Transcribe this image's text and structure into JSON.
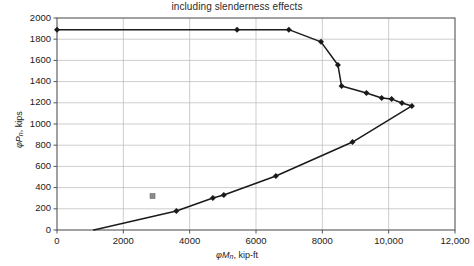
{
  "chart_data": {
    "type": "line",
    "title": "including slenderness effects",
    "xlabel": "φMn, kip-ft",
    "ylabel": "φPn, kips",
    "xlabel_parts": {
      "phi": "φ",
      "sym": "M",
      "sub": "n",
      "rest": ", kip-ft"
    },
    "ylabel_parts": {
      "phi": "φ",
      "sym": "P",
      "sub": "n",
      "rest": ", kips"
    },
    "xlim": [
      0,
      12000
    ],
    "ylim": [
      0,
      2000
    ],
    "xticks": [
      0,
      2000,
      4000,
      6000,
      8000,
      10000,
      12000
    ],
    "xtick_labels": [
      "0",
      "2000",
      "4000",
      "6000",
      "8000",
      "10,000",
      "12,000"
    ],
    "yticks": [
      0,
      200,
      400,
      600,
      800,
      1000,
      1200,
      1400,
      1600,
      1800,
      2000
    ],
    "ytick_labels": [
      "0",
      "200",
      "400",
      "600",
      "800",
      "1000",
      "1200",
      "1400",
      "1600",
      "1800",
      "2000"
    ],
    "grid": true,
    "legend": false,
    "line_color": "#1a1a1a",
    "grid_color": "#b9b9b9",
    "axis_color": "#555555",
    "series": [
      {
        "name": "interaction-diagram",
        "marker": "diamond",
        "points": [
          [
            0,
            1890
          ],
          [
            5430,
            1890
          ],
          [
            6990,
            1890
          ],
          [
            7960,
            1775
          ],
          [
            8470,
            1557
          ],
          [
            8580,
            1358
          ],
          [
            9330,
            1292
          ],
          [
            9790,
            1245
          ],
          [
            10090,
            1235
          ],
          [
            10400,
            1198
          ],
          [
            10700,
            1170
          ],
          [
            8910,
            830
          ],
          [
            6600,
            509
          ],
          [
            5030,
            330
          ],
          [
            4700,
            302
          ],
          [
            3600,
            179
          ],
          [
            1110,
            0
          ]
        ]
      }
    ],
    "stray_marker": {
      "x": 2880,
      "y": 320,
      "color": "#8a8a8a",
      "shape": "square"
    }
  }
}
